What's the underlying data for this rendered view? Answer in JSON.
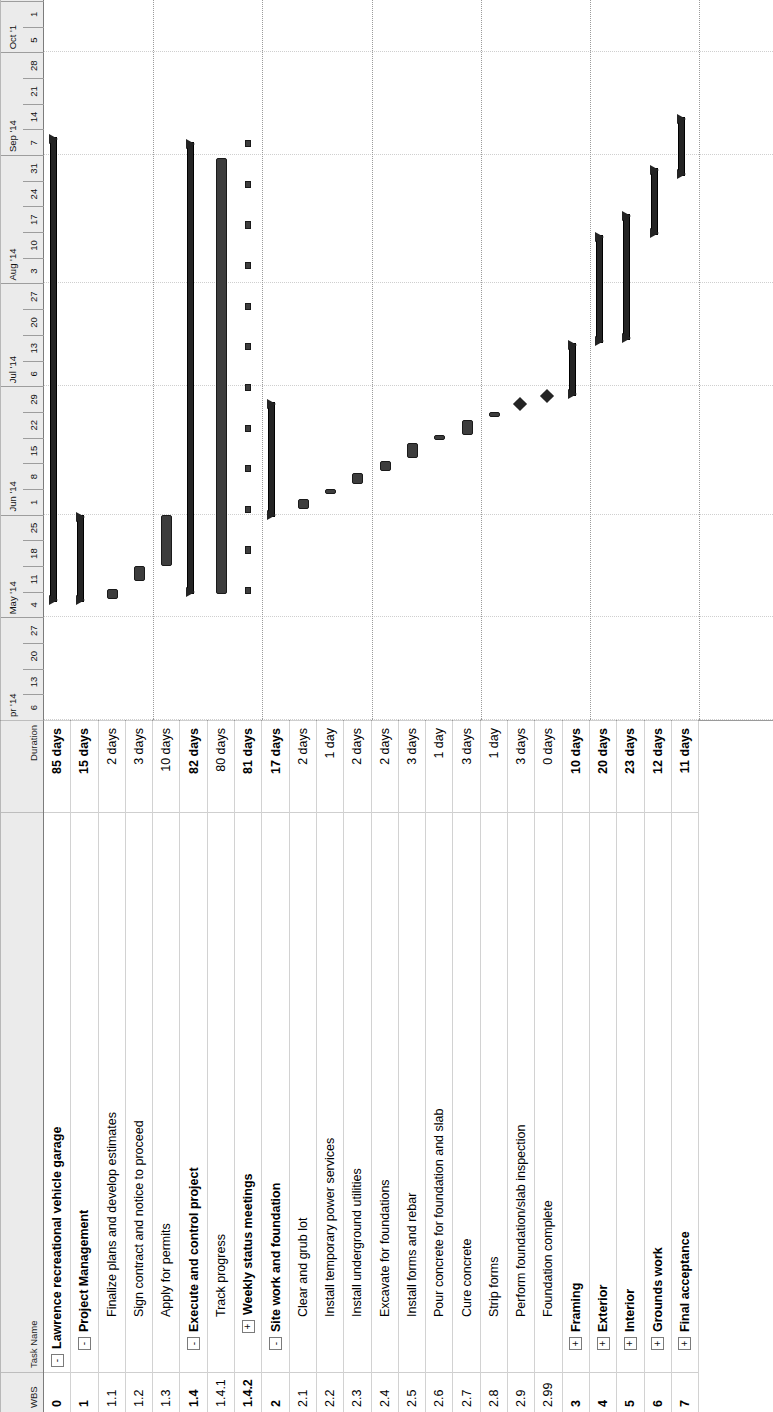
{
  "app": {
    "view_name": "Gantt Chart"
  },
  "table": {
    "headers": {
      "wbs": "WBS",
      "task_name": "Task Name",
      "duration": "Duration"
    },
    "rows": [
      {
        "wbs": "0",
        "name": "Lawrence recreational vehicle garage",
        "duration": "85 days",
        "indent": 1,
        "twist": "-",
        "summary": true
      },
      {
        "wbs": "1",
        "name": "Project Management",
        "duration": "15 days",
        "indent": 2,
        "twist": "-",
        "summary": true
      },
      {
        "wbs": "1.1",
        "name": "Finalize plans and develop estimates",
        "duration": "2 days",
        "indent": 3,
        "twist": "",
        "summary": false
      },
      {
        "wbs": "1.2",
        "name": "Sign contract and notice to proceed",
        "duration": "3 days",
        "indent": 3,
        "twist": "",
        "summary": false
      },
      {
        "wbs": "1.3",
        "name": "Apply for permits",
        "duration": "10 days",
        "indent": 3,
        "twist": "",
        "summary": false
      },
      {
        "wbs": "1.4",
        "name": "Execute and control project",
        "duration": "82 days",
        "indent": 2,
        "twist": "-",
        "summary": true
      },
      {
        "wbs": "1.4.1",
        "name": "Track progress",
        "duration": "80 days",
        "indent": 3,
        "twist": "",
        "summary": false
      },
      {
        "wbs": "1.4.2",
        "name": "Weekly status meetings",
        "duration": "81 days",
        "indent": 3,
        "twist": "+",
        "summary": true
      },
      {
        "wbs": "2",
        "name": "Site work and foundation",
        "duration": "17 days",
        "indent": 2,
        "twist": "-",
        "summary": true
      },
      {
        "wbs": "2.1",
        "name": "Clear and grub lot",
        "duration": "2 days",
        "indent": 3,
        "twist": "",
        "summary": false
      },
      {
        "wbs": "2.2",
        "name": "Install temporary power services",
        "duration": "1 day",
        "indent": 3,
        "twist": "",
        "summary": false
      },
      {
        "wbs": "2.3",
        "name": "Install underground utilities",
        "duration": "2 days",
        "indent": 3,
        "twist": "",
        "summary": false
      },
      {
        "wbs": "2.4",
        "name": "Excavate for foundations",
        "duration": "2 days",
        "indent": 3,
        "twist": "",
        "summary": false
      },
      {
        "wbs": "2.5",
        "name": "Install forms and rebar",
        "duration": "3 days",
        "indent": 3,
        "twist": "",
        "summary": false
      },
      {
        "wbs": "2.6",
        "name": "Pour concrete for foundation and slab",
        "duration": "1 day",
        "indent": 3,
        "twist": "",
        "summary": false
      },
      {
        "wbs": "2.7",
        "name": "Cure concrete",
        "duration": "3 days",
        "indent": 3,
        "twist": "",
        "summary": false
      },
      {
        "wbs": "2.8",
        "name": "Strip forms",
        "duration": "1 day",
        "indent": 3,
        "twist": "",
        "summary": false
      },
      {
        "wbs": "2.9",
        "name": "Perform foundation/slab inspection",
        "duration": "3 days",
        "indent": 3,
        "twist": "",
        "summary": false
      },
      {
        "wbs": "2.99",
        "name": "Foundation complete",
        "duration": "0 days",
        "indent": 3,
        "twist": "",
        "summary": false
      },
      {
        "wbs": "3",
        "name": "Framing",
        "duration": "10 days",
        "indent": 2,
        "twist": "+",
        "summary": true
      },
      {
        "wbs": "4",
        "name": "Exterior",
        "duration": "20 days",
        "indent": 2,
        "twist": "+",
        "summary": true
      },
      {
        "wbs": "5",
        "name": "Interior",
        "duration": "23 days",
        "indent": 2,
        "twist": "+",
        "summary": true
      },
      {
        "wbs": "6",
        "name": "Grounds work",
        "duration": "12 days",
        "indent": 2,
        "twist": "+",
        "summary": true
      },
      {
        "wbs": "7",
        "name": "Final acceptance",
        "duration": "11 days",
        "indent": 2,
        "twist": "+",
        "summary": true
      }
    ]
  },
  "chart_data": {
    "type": "gantt",
    "title": "Lawrence recreational vehicle garage",
    "timescale": {
      "major_unit": "month",
      "minor_unit": "week",
      "months": [
        {
          "label": "pr '14",
          "weeks": 4
        },
        {
          "label": "May '14",
          "weeks": 4
        },
        {
          "label": "Jun '14",
          "weeks": 5
        },
        {
          "label": "Jul '14",
          "weeks": 4
        },
        {
          "label": "Aug '14",
          "weeks": 5
        },
        {
          "label": "Sep '14",
          "weeks": 4
        },
        {
          "label": "Oct '1",
          "weeks": 2
        }
      ],
      "weeks": [
        "6",
        "13",
        "20",
        "27",
        "4",
        "11",
        "18",
        "25",
        "1",
        "8",
        "15",
        "22",
        "29",
        "6",
        "13",
        "20",
        "27",
        "3",
        "10",
        "17",
        "24",
        "31",
        "7",
        "14",
        "21",
        "28",
        "5",
        "1"
      ],
      "week_count": 28
    },
    "bars": [
      {
        "wbs": "0",
        "kind": "summary",
        "start_week": 4.6,
        "end_week": 22.7
      },
      {
        "wbs": "1",
        "kind": "summary",
        "start_week": 4.6,
        "end_week": 8.0
      },
      {
        "wbs": "1.1",
        "kind": "task",
        "start_week": 4.7,
        "end_week": 5.1
      },
      {
        "wbs": "1.2",
        "kind": "task",
        "start_week": 5.4,
        "end_week": 6.0
      },
      {
        "wbs": "1.3",
        "kind": "task",
        "start_week": 6.0,
        "end_week": 8.0
      },
      {
        "wbs": "1.4",
        "kind": "summary",
        "start_week": 4.9,
        "end_week": 22.5
      },
      {
        "wbs": "1.4.1",
        "kind": "task",
        "start_week": 4.9,
        "end_week": 21.9
      },
      {
        "wbs": "1.4.2",
        "kind": "recurring",
        "start_week": 4.9,
        "end_week": 22.3,
        "occurrences": 12
      },
      {
        "wbs": "2",
        "kind": "summary",
        "start_week": 7.9,
        "end_week": 12.4
      },
      {
        "wbs": "2.1",
        "kind": "task",
        "start_week": 8.2,
        "end_week": 8.6
      },
      {
        "wbs": "2.2",
        "kind": "task",
        "start_week": 8.8,
        "end_week": 9.0
      },
      {
        "wbs": "2.3",
        "kind": "task",
        "start_week": 9.2,
        "end_week": 9.6
      },
      {
        "wbs": "2.4",
        "kind": "task",
        "start_week": 9.7,
        "end_week": 10.1
      },
      {
        "wbs": "2.5",
        "kind": "task",
        "start_week": 10.2,
        "end_week": 10.8
      },
      {
        "wbs": "2.6",
        "kind": "task",
        "start_week": 10.9,
        "end_week": 11.1
      },
      {
        "wbs": "2.7",
        "kind": "task",
        "start_week": 11.1,
        "end_week": 11.7
      },
      {
        "wbs": "2.8",
        "kind": "task",
        "start_week": 11.8,
        "end_week": 12.0
      },
      {
        "wbs": "2.9",
        "kind": "milestone",
        "start_week": 12.3,
        "end_week": 12.3
      },
      {
        "wbs": "2.99",
        "kind": "milestone",
        "start_week": 12.6,
        "end_week": 12.6
      },
      {
        "wbs": "3",
        "kind": "summary",
        "start_week": 12.6,
        "end_week": 14.7
      },
      {
        "wbs": "4",
        "kind": "summary",
        "start_week": 14.7,
        "end_week": 18.9
      },
      {
        "wbs": "5",
        "kind": "summary",
        "start_week": 14.8,
        "end_week": 19.7
      },
      {
        "wbs": "6",
        "kind": "summary",
        "start_week": 18.9,
        "end_week": 21.5
      },
      {
        "wbs": "7",
        "kind": "summary",
        "start_week": 21.2,
        "end_week": 23.5
      }
    ]
  }
}
